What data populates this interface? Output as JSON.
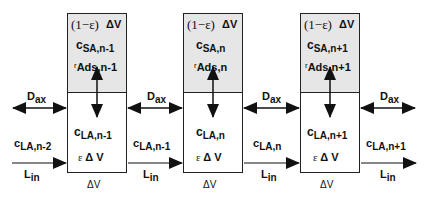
{
  "diagram": {
    "type": "stage-wise adsorption column model",
    "colors": {
      "upper_fill": "#e6e6e6",
      "lower_fill": "#ffffff",
      "line": "#222222"
    },
    "cells": [
      {
        "upper": {
          "volume": "(1−ε)",
          "volume_dv": "ΔV",
          "conc_main": "c",
          "conc_sub": "SA,n-1",
          "rate_main": "r",
          "rate_sub": "Ads,n-1"
        },
        "lower": {
          "conc_main": "c",
          "conc_sub": "LA,n-1",
          "eps": "ε",
          "dv": "Δ V"
        },
        "below": "ΔV"
      },
      {
        "upper": {
          "volume": "(1−ε)",
          "volume_dv": "ΔV",
          "conc_main": "c",
          "conc_sub": "SA,n",
          "rate_main": "r",
          "rate_sub": "Ads,n"
        },
        "lower": {
          "conc_main": "c",
          "conc_sub": "LA,n",
          "eps": "ε",
          "dv": "Δ V"
        },
        "below": "ΔV"
      },
      {
        "upper": {
          "volume": "(1−ε)",
          "volume_dv": "ΔV",
          "conc_main": "c",
          "conc_sub": "SA,n+1",
          "rate_main": "r",
          "rate_sub": "Ads,n+1"
        },
        "lower": {
          "conc_main": "c",
          "conc_sub": "LA,n+1",
          "eps": "ε",
          "dv": "Δ V"
        },
        "below": "ΔV"
      }
    ],
    "links": [
      {
        "dax_main": "D",
        "dax_sub": "ax",
        "flow_main": "c",
        "flow_sub": "LA,n-2",
        "lin": "L",
        "lin_sub": "in"
      },
      {
        "dax_main": "D",
        "dax_sub": "ax",
        "flow_main": "c",
        "flow_sub": "LA,n-1",
        "lin": "L",
        "lin_sub": "in"
      },
      {
        "dax_main": "D",
        "dax_sub": "ax",
        "flow_main": "c",
        "flow_sub": "LA,n",
        "lin": "L",
        "lin_sub": "in"
      },
      {
        "dax_main": "D",
        "dax_sub": "ax",
        "flow_main": "c",
        "flow_sub": "LA,n+1",
        "lin": "L",
        "lin_sub": "in"
      }
    ]
  }
}
